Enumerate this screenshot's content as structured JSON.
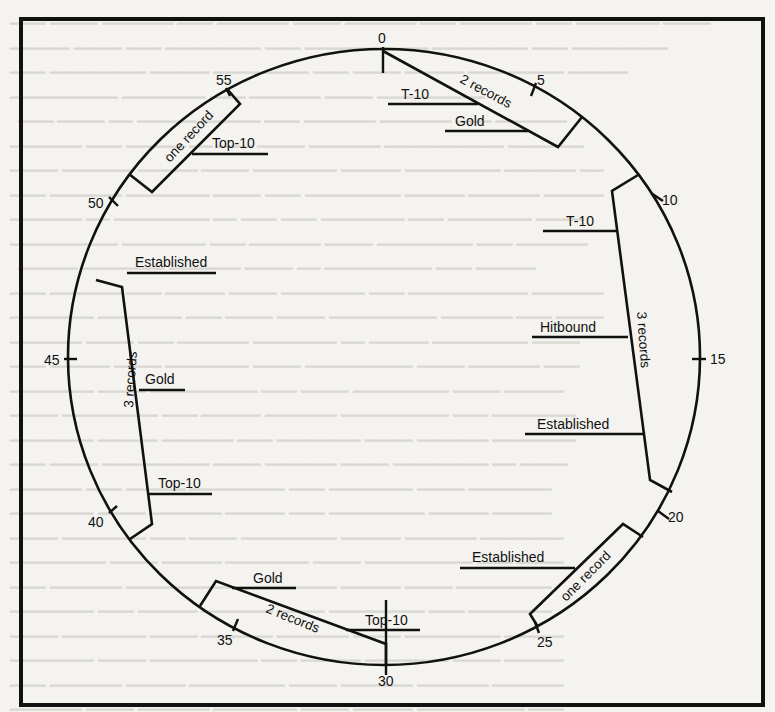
{
  "figure": {
    "type": "radio format clock (hot clock)",
    "clock_ticks": [
      {
        "minute": "0"
      },
      {
        "minute": "5"
      },
      {
        "minute": "10"
      },
      {
        "minute": "15"
      },
      {
        "minute": "20"
      },
      {
        "minute": "25"
      },
      {
        "minute": "30"
      },
      {
        "minute": "35"
      },
      {
        "minute": "40"
      },
      {
        "minute": "45"
      },
      {
        "minute": "50"
      },
      {
        "minute": "55"
      }
    ],
    "segments": [
      {
        "count_label": "2 records",
        "items": [
          "T-10",
          "Gold"
        ]
      },
      {
        "count_label": "3 records",
        "items": [
          "T-10",
          "Hitbound",
          "Established"
        ]
      },
      {
        "count_label": "one record",
        "items": [
          "Established"
        ]
      },
      {
        "count_label": "2 records",
        "items": [
          "Top-10",
          "Gold"
        ]
      },
      {
        "count_label": "3 records",
        "items": [
          "Top-10",
          "Gold",
          "Established"
        ]
      },
      {
        "count_label": "one record",
        "items": [
          "Top-10"
        ]
      }
    ]
  },
  "colors": {
    "ink": "#111111",
    "paper": "#f4f3ef",
    "bleed_through": "#d6d4ce"
  }
}
